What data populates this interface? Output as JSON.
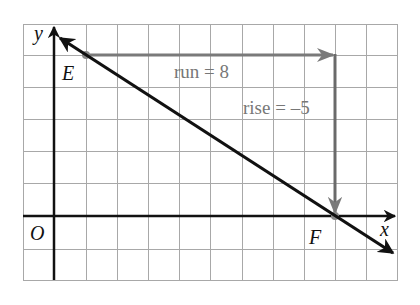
{
  "diagram": {
    "type": "coordinate-grid-slope",
    "grid": {
      "x_min": -1,
      "x_max": 11,
      "y_min": -2,
      "y_max": 6,
      "cell_px_x": 31.2,
      "cell_px_y": 32.1
    },
    "axes": {
      "x_label": "x",
      "y_label": "y",
      "origin_label": "O"
    },
    "points": [
      {
        "name": "E",
        "x": 1,
        "y": 5
      },
      {
        "name": "F",
        "x": 9,
        "y": 0
      }
    ],
    "line": {
      "through": [
        "E",
        "F"
      ],
      "slope": "-5/8"
    },
    "annotations": {
      "run_label": "run = 8",
      "rise_label": "rise = –5"
    },
    "colors": {
      "grid": "#9a9a9a",
      "axis": "#111111",
      "line": "#111111",
      "run_rise": "#7a7a7a",
      "text_gray": "#777777"
    }
  }
}
